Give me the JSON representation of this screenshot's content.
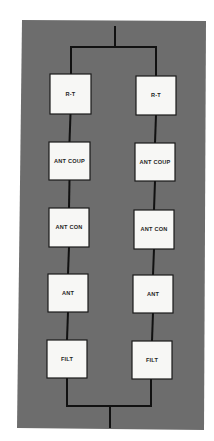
{
  "diagram": {
    "type": "parallel-redundant-chain",
    "background_color": "#6d6d6d",
    "block_fill_color": "#f7f7f5",
    "line_color": "#111111",
    "branches": [
      {
        "name": "left",
        "blocks": [
          {
            "label": "R-T"
          },
          {
            "label": "ANT COUP"
          },
          {
            "label": "ANT CON"
          },
          {
            "label": "ANT"
          },
          {
            "label": "FILT"
          }
        ]
      },
      {
        "name": "right",
        "blocks": [
          {
            "label": "R-T"
          },
          {
            "label": "ANT COUP"
          },
          {
            "label": "ANT CON"
          },
          {
            "label": "ANT"
          },
          {
            "label": "FILT"
          }
        ]
      }
    ],
    "connections": {
      "top": "single input splits into both branches",
      "bottom": "both branches merge into single output"
    }
  }
}
